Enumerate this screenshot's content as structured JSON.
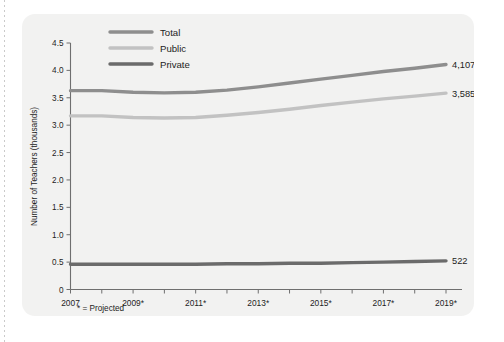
{
  "chart_data": {
    "type": "line",
    "title": "",
    "xlabel": "",
    "ylabel": "Number of Teachers (thousands)",
    "ylim": [
      0,
      4.5
    ],
    "ytick_labels": [
      "0",
      "0.5",
      "1.0",
      "1.5",
      "2.0",
      "2.5",
      "3.0",
      "3.5",
      "4.0",
      "4.5"
    ],
    "ytick_values": [
      0,
      0.5,
      1.0,
      1.5,
      2.0,
      2.5,
      3.0,
      3.5,
      4.0,
      4.5
    ],
    "x": [
      2007,
      2008,
      2009,
      2010,
      2011,
      2012,
      2013,
      2014,
      2015,
      2016,
      2017,
      2018,
      2019
    ],
    "xtick_labels": [
      "2007",
      "2009*",
      "2011*",
      "2013*",
      "2015*",
      "2017*",
      "2019*"
    ],
    "xtick_values": [
      2007,
      2009,
      2011,
      2013,
      2015,
      2017,
      2019
    ],
    "grid": false,
    "legend_position": "top-left",
    "footnote": "* = Projected",
    "series": [
      {
        "name": "Total",
        "color": "#8e8e8e",
        "end_label": "4,107",
        "values": [
          3.63,
          3.63,
          3.6,
          3.59,
          3.6,
          3.64,
          3.7,
          3.77,
          3.84,
          3.91,
          3.98,
          4.04,
          4.107
        ]
      },
      {
        "name": "Public",
        "color": "#c2c2c2",
        "end_label": "3,585",
        "values": [
          3.17,
          3.17,
          3.14,
          3.13,
          3.14,
          3.18,
          3.23,
          3.29,
          3.36,
          3.42,
          3.48,
          3.53,
          3.585
        ]
      },
      {
        "name": "Private",
        "color": "#6b6b6b",
        "end_label": "522",
        "values": [
          0.46,
          0.46,
          0.46,
          0.46,
          0.46,
          0.47,
          0.47,
          0.48,
          0.48,
          0.49,
          0.5,
          0.51,
          0.522
        ]
      }
    ]
  },
  "legend": {
    "items": [
      {
        "label": "Total"
      },
      {
        "label": "Public"
      },
      {
        "label": "Private"
      }
    ]
  },
  "colors": {
    "panel_background": "#f2f2f1",
    "axis": "#6f6f6f",
    "text": "#1d1d1d"
  }
}
